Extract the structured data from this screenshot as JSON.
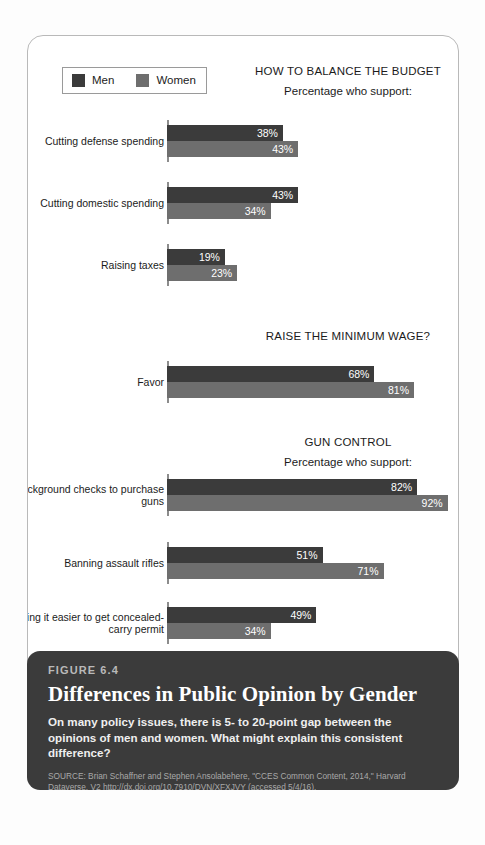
{
  "legend": {
    "entries": [
      {
        "label": "Men",
        "color": "#3b3b3b"
      },
      {
        "label": "Women",
        "color": "#6e6e6e"
      }
    ]
  },
  "caption": {
    "figure_number": "FIGURE 6.4",
    "title": "Differences in Public Opinion by Gender",
    "subtitle": "On many policy issues, there is 5- to 20-point gap between the opinions of men and women. What might explain this consistent difference?",
    "source": "SOURCE: Brian Schaffner and Stephen Ansolabehere, \"CCES Common Content, 2014,\" Harvard Dataverse, V2 http://dx.doi.org/10.7910/DVN/XFXJVY (accessed 5/4/16)."
  },
  "chart_data": {
    "type": "bar",
    "title": "Differences in Public Opinion by Gender",
    "orientation": "horizontal",
    "xlabel": "",
    "ylabel": "",
    "xlim": [
      0,
      100
    ],
    "grid": false,
    "legend_position": "top-left",
    "series_names": [
      "Men",
      "Women"
    ],
    "series_colors": [
      "#3b3b3b",
      "#6e6e6e"
    ],
    "value_suffix": "%",
    "sections": [
      {
        "heading": "HOW TO BALANCE THE BUDGET",
        "subheading": "Percentage who support:",
        "categories": [
          {
            "label": "Cutting defense spending",
            "men": 38,
            "women": 43,
            "men_text": "38%",
            "women_text": "43%"
          },
          {
            "label": "Cutting domestic spending",
            "men": 43,
            "women": 34,
            "men_text": "43%",
            "women_text": "34%"
          },
          {
            "label": "Raising taxes",
            "men": 19,
            "women": 23,
            "men_text": "19%",
            "women_text": "23%"
          }
        ]
      },
      {
        "heading": "RAISE THE MINIMUM WAGE?",
        "subheading": "",
        "categories": [
          {
            "label": "Favor",
            "men": 68,
            "women": 81,
            "men_text": "68%",
            "women_text": "81%"
          }
        ]
      },
      {
        "heading": "GUN CONTROL",
        "subheading": "Percentage who support:",
        "categories": [
          {
            "label": "Background checks to purchase guns",
            "men": 82,
            "women": 92,
            "men_text": "82%",
            "women_text": "92%"
          },
          {
            "label": "Banning assault rifles",
            "men": 51,
            "women": 71,
            "men_text": "51%",
            "women_text": "71%"
          },
          {
            "label": "Making it easier to get concealed-carry permit",
            "men": 49,
            "women": 34,
            "men_text": "49%",
            "women_text": "34%"
          }
        ]
      }
    ]
  }
}
